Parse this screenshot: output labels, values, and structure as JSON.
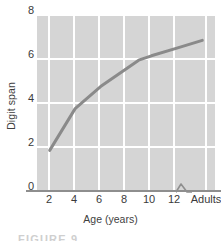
{
  "chart_data": {
    "type": "line",
    "title": "",
    "subtitle": "",
    "xlabel": "Age (years)",
    "ylabel": "Digit span",
    "x_tick_labels": [
      "2",
      "4",
      "6",
      "8",
      "10",
      "12",
      "Adults"
    ],
    "y_tick_labels": [
      "0",
      "2",
      "4",
      "6",
      "8"
    ],
    "y_tick_values": [
      0,
      2,
      4,
      6,
      8
    ],
    "xlim": [
      1,
      15
    ],
    "ylim": [
      0,
      8
    ],
    "grid": true,
    "legend": null,
    "axis_break": {
      "present": true,
      "between": [
        "12",
        "Adults"
      ],
      "glyph": "zigzag-break"
    },
    "series": [
      {
        "name": "Digit span by age",
        "x_labels": [
          "2",
          "4",
          "6",
          "8",
          "9",
          "10",
          "12",
          "Adults"
        ],
        "x": [
          2,
          4,
          6,
          8,
          9,
          10,
          12,
          14
        ],
        "values": [
          1.8,
          3.7,
          4.7,
          5.5,
          5.9,
          6.1,
          6.45,
          6.8
        ],
        "color": "#8a8a8a",
        "line_width": 3,
        "markers": false
      }
    ],
    "colors": {
      "plot_background": "#d5d5d5",
      "gridline": "#ffffff",
      "axis_line": "#8e8e8e",
      "series_line": "#8a8a8a",
      "text": "#3a3a3a",
      "page_background": "#ffffff"
    }
  },
  "caption": {
    "text": "FIGURE 9"
  }
}
